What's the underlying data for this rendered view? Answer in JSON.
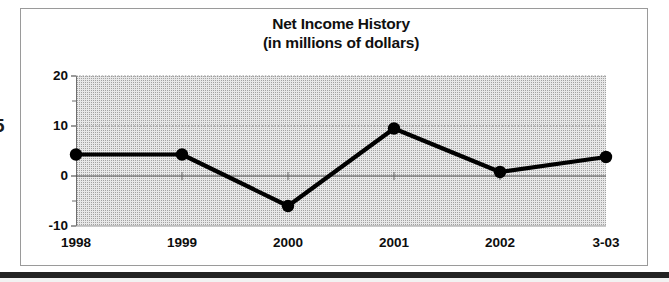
{
  "figure": {
    "left_margin_partial_glyph": "5"
  },
  "chart_data": {
    "type": "line",
    "title": "Net Income History",
    "subtitle": "(in millions of dollars)",
    "xlabel": "",
    "ylabel": "",
    "categories": [
      "1998",
      "1999",
      "2000",
      "2001",
      "2002",
      "3-03"
    ],
    "values": [
      4.3,
      4.3,
      -6.0,
      9.5,
      0.8,
      3.8
    ],
    "series": [
      {
        "name": "Net Income",
        "values": [
          4.3,
          4.3,
          -6.0,
          9.5,
          0.8,
          3.8
        ]
      }
    ],
    "ylim": [
      -10,
      20
    ],
    "xlim": [
      0,
      5
    ],
    "y_major_ticks": [
      20,
      10,
      0,
      -10
    ],
    "y_major_tick_labels": [
      "20",
      "10",
      "0",
      "-10"
    ],
    "y_minor_ticks": [
      15,
      5,
      -5
    ],
    "grid": true,
    "grid_axis": "y",
    "legend": false,
    "legend_position": "none",
    "marker": "circle",
    "line_color": "#000000",
    "marker_color": "#000000",
    "plot_background": "#e8e8e8"
  }
}
